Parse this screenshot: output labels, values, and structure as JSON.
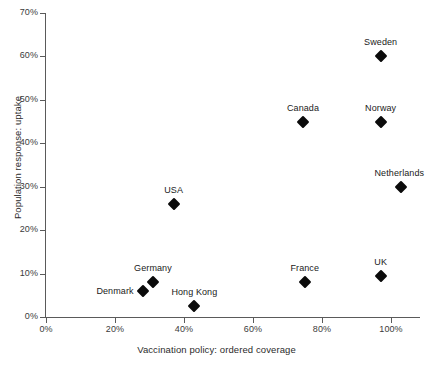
{
  "chart_data": {
    "type": "scatter",
    "title": "",
    "xlabel": "Vaccination policy: ordered coverage",
    "ylabel": "Population response: uptake",
    "xlim": [
      0,
      108
    ],
    "ylim": [
      0,
      70
    ],
    "grid": false,
    "legend": null,
    "x_ticks": [
      "0%",
      "20%",
      "40%",
      "60%",
      "80%",
      "100%"
    ],
    "x_tick_values": [
      0,
      20,
      40,
      60,
      80,
      100
    ],
    "y_ticks": [
      "0%",
      "10%",
      "20%",
      "30%",
      "40%",
      "50%",
      "60%",
      "70%"
    ],
    "y_tick_values": [
      0,
      10,
      20,
      30,
      40,
      50,
      60,
      70
    ],
    "points": [
      {
        "label": "Sweden",
        "x": 97,
        "y": 60,
        "label_dx": 0,
        "label_dy": -14,
        "label_align": "center"
      },
      {
        "label": "Canada",
        "x": 74.5,
        "y": 45,
        "label_dx": 0,
        "label_dy": -14,
        "label_align": "center"
      },
      {
        "label": "Norway",
        "x": 97,
        "y": 45,
        "label_dx": 0,
        "label_dy": -14,
        "label_align": "center"
      },
      {
        "label": "Netherlands",
        "x": 103,
        "y": 30,
        "label_dx": -2,
        "label_dy": -14,
        "label_align": "center"
      },
      {
        "label": "USA",
        "x": 37,
        "y": 26,
        "label_dx": 0,
        "label_dy": -14,
        "label_align": "center"
      },
      {
        "label": "UK",
        "x": 97,
        "y": 9.5,
        "label_dx": 0,
        "label_dy": -14,
        "label_align": "center"
      },
      {
        "label": "France",
        "x": 75,
        "y": 8,
        "label_dx": 0,
        "label_dy": -14,
        "label_align": "center"
      },
      {
        "label": "Germany",
        "x": 31,
        "y": 8,
        "label_dx": 0,
        "label_dy": -14,
        "label_align": "center"
      },
      {
        "label": "Denmark",
        "x": 28,
        "y": 6,
        "label_dx": -9,
        "label_dy": 0,
        "label_align": "right"
      },
      {
        "label": "Hong Kong",
        "x": 43,
        "y": 2.5,
        "label_dx": 0,
        "label_dy": -14,
        "label_align": "center"
      }
    ]
  }
}
